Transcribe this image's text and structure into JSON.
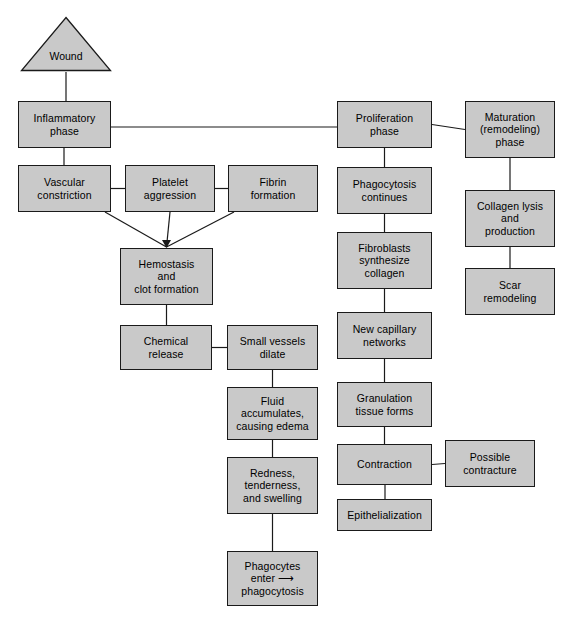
{
  "diagram": {
    "style": {
      "node_fill": "#c9c9c9",
      "node_stroke": "#1a1a1a",
      "edge_stroke": "#1a1a1a",
      "background": "#ffffff",
      "text_color": "#000000"
    },
    "nodes": [
      {
        "id": "wound",
        "label": "Wound",
        "shape": "triangle",
        "x": 20,
        "y": 16,
        "w": 92,
        "h": 56
      },
      {
        "id": "inflammatory",
        "label": "Inflammatory\nphase",
        "shape": "rect",
        "x": 18,
        "y": 101,
        "w": 93,
        "h": 47
      },
      {
        "id": "proliferation",
        "label": "Proliferation\nphase",
        "shape": "rect",
        "x": 337,
        "y": 101,
        "w": 95,
        "h": 47
      },
      {
        "id": "maturation",
        "label": "Maturation\n(remodeling)\nphase",
        "shape": "rect",
        "x": 465,
        "y": 101,
        "w": 90,
        "h": 57
      },
      {
        "id": "vascular",
        "label": "Vascular\nconstriction",
        "shape": "rect",
        "x": 18,
        "y": 165,
        "w": 93,
        "h": 47
      },
      {
        "id": "platelet",
        "label": "Platelet\naggression",
        "shape": "rect",
        "x": 125,
        "y": 165,
        "w": 90,
        "h": 47
      },
      {
        "id": "fibrin",
        "label": "Fibrin\nformation",
        "shape": "rect",
        "x": 228,
        "y": 165,
        "w": 90,
        "h": 47
      },
      {
        "id": "phagocytosis_c",
        "label": "Phagocytosis\ncontinues",
        "shape": "rect",
        "x": 337,
        "y": 167,
        "w": 95,
        "h": 47
      },
      {
        "id": "collagen_lysis",
        "label": "Collagen lysis\nand\nproduction",
        "shape": "rect",
        "x": 465,
        "y": 190,
        "w": 90,
        "h": 57
      },
      {
        "id": "hemostasis",
        "label": "Hemostasis\nand\nclot formation",
        "shape": "rect",
        "x": 120,
        "y": 248,
        "w": 93,
        "h": 57
      },
      {
        "id": "fibroblasts",
        "label": "Fibroblasts\nsynthesize\ncollagen",
        "shape": "rect",
        "x": 337,
        "y": 232,
        "w": 95,
        "h": 57
      },
      {
        "id": "scar",
        "label": "Scar\nremodeling",
        "shape": "rect",
        "x": 465,
        "y": 268,
        "w": 90,
        "h": 47
      },
      {
        "id": "chemical",
        "label": "Chemical\nrelease",
        "shape": "rect",
        "x": 120,
        "y": 325,
        "w": 92,
        "h": 45
      },
      {
        "id": "small_vessels",
        "label": "Small vessels\ndilate",
        "shape": "rect",
        "x": 227,
        "y": 325,
        "w": 91,
        "h": 45
      },
      {
        "id": "new_capillary",
        "label": "New capillary\nnetworks",
        "shape": "rect",
        "x": 337,
        "y": 312,
        "w": 95,
        "h": 47
      },
      {
        "id": "fluid",
        "label": "Fluid\naccumulates,\ncausing edema",
        "shape": "rect",
        "x": 227,
        "y": 387,
        "w": 91,
        "h": 53
      },
      {
        "id": "granulation",
        "label": "Granulation\ntissue forms",
        "shape": "rect",
        "x": 337,
        "y": 382,
        "w": 95,
        "h": 45
      },
      {
        "id": "contraction",
        "label": "Contraction",
        "shape": "rect",
        "x": 337,
        "y": 444,
        "w": 95,
        "h": 41
      },
      {
        "id": "possible_contr",
        "label": "Possible\ncontracture",
        "shape": "rect",
        "x": 445,
        "y": 440,
        "w": 90,
        "h": 47
      },
      {
        "id": "redness",
        "label": "Redness,\ntenderness,\nand swelling",
        "shape": "rect",
        "x": 227,
        "y": 457,
        "w": 91,
        "h": 57
      },
      {
        "id": "epithelialization",
        "label": "Epithelialization",
        "shape": "rect",
        "x": 337,
        "y": 499,
        "w": 95,
        "h": 32
      },
      {
        "id": "phagocytes",
        "label": "Phagocytes\nenter ⟶\nphagocytosis",
        "shape": "rect",
        "x": 227,
        "y": 551,
        "w": 91,
        "h": 55
      }
    ],
    "edges": [
      {
        "from": "wound",
        "to": "inflammatory",
        "type": "vertical"
      },
      {
        "from": "inflammatory",
        "to": "proliferation",
        "type": "horizontal"
      },
      {
        "from": "proliferation",
        "to": "maturation",
        "type": "horizontal"
      },
      {
        "from": "inflammatory",
        "to": "vascular",
        "type": "vertical"
      },
      {
        "from": "vascular",
        "to": "platelet",
        "type": "horizontal"
      },
      {
        "from": "platelet",
        "to": "fibrin",
        "type": "horizontal"
      },
      {
        "from": "vascular",
        "to": "hemostasis",
        "type": "converge-arrow"
      },
      {
        "from": "platelet",
        "to": "hemostasis",
        "type": "converge-arrow"
      },
      {
        "from": "fibrin",
        "to": "hemostasis",
        "type": "converge-arrow"
      },
      {
        "from": "hemostasis",
        "to": "chemical",
        "type": "vertical"
      },
      {
        "from": "chemical",
        "to": "small_vessels",
        "type": "horizontal"
      },
      {
        "from": "small_vessels",
        "to": "fluid",
        "type": "vertical"
      },
      {
        "from": "fluid",
        "to": "redness",
        "type": "vertical"
      },
      {
        "from": "redness",
        "to": "phagocytes",
        "type": "vertical"
      },
      {
        "from": "proliferation",
        "to": "phagocytosis_c",
        "type": "vertical"
      },
      {
        "from": "phagocytosis_c",
        "to": "fibroblasts",
        "type": "vertical"
      },
      {
        "from": "fibroblasts",
        "to": "new_capillary",
        "type": "vertical"
      },
      {
        "from": "new_capillary",
        "to": "granulation",
        "type": "vertical"
      },
      {
        "from": "granulation",
        "to": "contraction",
        "type": "vertical"
      },
      {
        "from": "contraction",
        "to": "possible_contr",
        "type": "horizontal"
      },
      {
        "from": "contraction",
        "to": "epithelialization",
        "type": "vertical"
      },
      {
        "from": "maturation",
        "to": "collagen_lysis",
        "type": "vertical"
      },
      {
        "from": "collagen_lysis",
        "to": "scar",
        "type": "vertical"
      }
    ]
  }
}
